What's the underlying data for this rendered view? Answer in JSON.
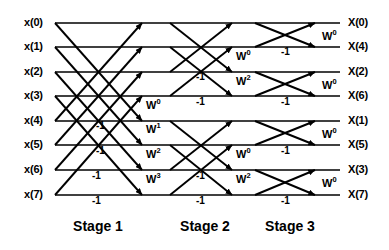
{
  "diagram": {
    "type": "signal-flow-graph",
    "line_color": "#000000",
    "background_color": "#ffffff",
    "num_points": 8,
    "num_stages": 3
  },
  "inputs": [
    {
      "label": "x(0)",
      "y": 23
    },
    {
      "label": "x(1)",
      "y": 47
    },
    {
      "label": "x(2)",
      "y": 72
    },
    {
      "label": "x(3)",
      "y": 96
    },
    {
      "label": "x(4)",
      "y": 121
    },
    {
      "label": "x(5)",
      "y": 145
    },
    {
      "label": "x(6)",
      "y": 170
    },
    {
      "label": "x(7)",
      "y": 195
    }
  ],
  "outputs": [
    {
      "label": "X(0)",
      "y": 23
    },
    {
      "label": "X(4)",
      "y": 47
    },
    {
      "label": "X(2)",
      "y": 72
    },
    {
      "label": "X(6)",
      "y": 96
    },
    {
      "label": "X(1)",
      "y": 121
    },
    {
      "label": "X(5)",
      "y": 145
    },
    {
      "label": "X(3)",
      "y": 170
    },
    {
      "label": "X(7)",
      "y": 195
    }
  ],
  "stages": [
    {
      "name": "Stage 1",
      "label_x": 98,
      "span": 4
    },
    {
      "name": "Stage 2",
      "label_x": 205,
      "span": 2
    },
    {
      "name": "Stage 3",
      "label_x": 290,
      "span": 1
    }
  ],
  "stage_label_y": 218,
  "twiddles": [
    {
      "base": "W",
      "exp": "0",
      "x": 146,
      "y": 106,
      "stage": 1
    },
    {
      "base": "W",
      "exp": "1",
      "x": 146,
      "y": 130,
      "stage": 1
    },
    {
      "base": "W",
      "exp": "2",
      "x": 146,
      "y": 155,
      "stage": 1
    },
    {
      "base": "W",
      "exp": "3",
      "x": 146,
      "y": 180,
      "stage": 1
    },
    {
      "base": "W",
      "exp": "0",
      "x": 236,
      "y": 57,
      "stage": 2
    },
    {
      "base": "W",
      "exp": "2",
      "x": 236,
      "y": 82,
      "stage": 2
    },
    {
      "base": "W",
      "exp": "0",
      "x": 236,
      "y": 155,
      "stage": 2
    },
    {
      "base": "W",
      "exp": "2",
      "x": 236,
      "y": 180,
      "stage": 2
    },
    {
      "base": "W",
      "exp": "0",
      "x": 322,
      "y": 37,
      "stage": 3
    },
    {
      "base": "W",
      "exp": "0",
      "x": 322,
      "y": 86,
      "stage": 3
    },
    {
      "base": "W",
      "exp": "0",
      "x": 322,
      "y": 135,
      "stage": 3
    },
    {
      "base": "W",
      "exp": "0",
      "x": 322,
      "y": 184,
      "stage": 3
    }
  ],
  "minus_ones": [
    {
      "text": "-1",
      "x": 96,
      "y": 126,
      "stage": 1
    },
    {
      "text": "-1",
      "x": 96,
      "y": 151,
      "stage": 1
    },
    {
      "text": "-1",
      "x": 92,
      "y": 176,
      "stage": 1
    },
    {
      "text": "-1",
      "x": 92,
      "y": 201,
      "stage": 1
    },
    {
      "text": "-1",
      "x": 196,
      "y": 77,
      "stage": 2
    },
    {
      "text": "-1",
      "x": 196,
      "y": 102,
      "stage": 2
    },
    {
      "text": "-1",
      "x": 196,
      "y": 176,
      "stage": 2
    },
    {
      "text": "-1",
      "x": 196,
      "y": 201,
      "stage": 2
    },
    {
      "text": "-1",
      "x": 281,
      "y": 52,
      "stage": 3
    },
    {
      "text": "-1",
      "x": 281,
      "y": 102,
      "stage": 3
    },
    {
      "text": "-1",
      "x": 281,
      "y": 151,
      "stage": 3
    },
    {
      "text": "-1",
      "x": 281,
      "y": 201,
      "stage": 3
    }
  ],
  "geometry": {
    "row_ys": [
      23,
      47,
      72,
      96,
      121,
      145,
      170,
      195
    ],
    "rail_x_start": 55,
    "rail_x_end": 340,
    "stage1_x": [
      55,
      142
    ],
    "stage2_x": [
      170,
      232
    ],
    "stage3_x": [
      255,
      315
    ],
    "input_label_x": 24,
    "output_label_x": 348
  }
}
